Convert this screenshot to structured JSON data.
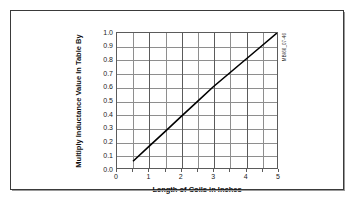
{
  "figure": {
    "id_label": "MBI66_07-46",
    "background_color": "#ffffff",
    "frame_color": "#3a3a3a",
    "line_color": "#000000",
    "grid_color": "#8e8e8e"
  },
  "chart_data": {
    "type": "line",
    "title": "",
    "subtitle": "",
    "xlabel": "Length of Coils in Inches",
    "ylabel": "Multiply Inductance Value In Table By",
    "xlim": [
      0,
      5
    ],
    "ylim": [
      0.0,
      1.0
    ],
    "grid": true,
    "legend": null,
    "legend_position": "none",
    "x_major_ticks": [
      0,
      1,
      2,
      3,
      4,
      5
    ],
    "x_minor_ticks": [
      0.5,
      1.5,
      2.5,
      3.5,
      4.5
    ],
    "x_tick_labels": [
      "0",
      "1",
      "2",
      "3",
      "4",
      "5"
    ],
    "y_ticks": [
      0.0,
      0.1,
      0.2,
      0.3,
      0.4,
      0.5,
      0.6,
      0.7,
      0.8,
      0.9,
      1.0
    ],
    "y_tick_labels": [
      "0.0",
      "0.1",
      "0.2",
      "0.3",
      "0.4",
      "0.5",
      "0.6",
      "0.7",
      "0.8",
      "0.9",
      "1.0"
    ],
    "series": [
      {
        "name": "Inductance multiplier",
        "x": [
          0.5,
          1.0,
          1.5,
          2.0,
          2.5,
          3.0,
          3.5,
          4.0,
          4.5,
          5.0
        ],
        "values": [
          0.05,
          0.16,
          0.27,
          0.38,
          0.49,
          0.6,
          0.7,
          0.8,
          0.9,
          1.0
        ]
      }
    ],
    "annotations": []
  }
}
